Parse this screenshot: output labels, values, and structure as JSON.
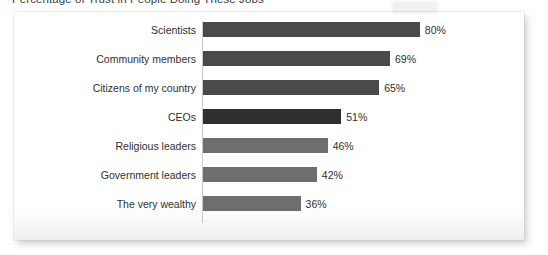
{
  "chart_data": {
    "type": "bar",
    "orientation": "horizontal",
    "title": "Percentage of Trust in People Doing These Jobs",
    "xlabel": "",
    "ylabel": "",
    "xlim": [
      0,
      100
    ],
    "grid": false,
    "legend": null,
    "value_suffix": "%",
    "categories": [
      "Scientists",
      "Community members",
      "Citizens of my country",
      "CEOs",
      "Religious leaders",
      "Government leaders",
      "The very wealthy"
    ],
    "values": [
      80,
      69,
      65,
      51,
      46,
      42,
      36
    ],
    "value_labels": [
      "80%",
      "69%",
      "65%",
      "51%",
      "46%",
      "42%",
      "36%"
    ],
    "bar_colors": [
      "#4a4a4a",
      "#4a4a4a",
      "#4a4a4a",
      "#2f2f2f",
      "#6e6e6e",
      "#6e6e6e",
      "#6e6e6e"
    ]
  },
  "style": {
    "panel_background": "#ffffff",
    "page_background": "#ffffff",
    "axis_color": "#c9c9c9",
    "text_color": "#2f2f2f",
    "title_color": "#3b3b3b"
  }
}
